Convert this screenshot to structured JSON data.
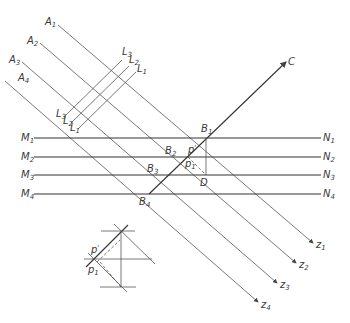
{
  "diagram": {
    "type": "geometric-construction",
    "rays": [
      {
        "start_label": "A",
        "start_sub": "1",
        "end_label": "z",
        "end_sub": "1"
      },
      {
        "start_label": "A",
        "start_sub": "2",
        "end_label": "z",
        "end_sub": "2"
      },
      {
        "start_label": "A",
        "start_sub": "3",
        "end_label": "z",
        "end_sub": "3"
      },
      {
        "start_label": "A",
        "start_sub": "4",
        "end_label": "z",
        "end_sub": "4"
      }
    ],
    "horizontals": [
      {
        "left_label": "M",
        "left_sub": "1",
        "right_label": "N",
        "right_sub": "1"
      },
      {
        "left_label": "M",
        "left_sub": "2",
        "right_label": "N",
        "right_sub": "2"
      },
      {
        "left_label": "M",
        "left_sub": "3",
        "right_label": "N",
        "right_sub": "3"
      },
      {
        "left_label": "M",
        "left_sub": "4",
        "right_label": "N",
        "right_sub": "4"
      }
    ],
    "intersections": [
      {
        "label": "B",
        "sub": "1"
      },
      {
        "label": "B",
        "sub": "2"
      },
      {
        "label": "B",
        "sub": "3"
      },
      {
        "label": "B",
        "sub": "4"
      }
    ],
    "ray_c_label": "C",
    "point_d_label": "D",
    "angle_upper": {
      "label": "p",
      "sup": "'"
    },
    "angle_lower": {
      "label": "p",
      "sub": "1"
    },
    "l_marks_upper": [
      {
        "label": "L",
        "sub": "3"
      },
      {
        "label": "L",
        "sub": "2"
      },
      {
        "label": "L",
        "sub": "1"
      }
    ],
    "l_marks_lower": [
      {
        "label": "L",
        "sub": "3"
      },
      {
        "label": "L",
        "sub": "2"
      },
      {
        "label": "L",
        "sub": "1"
      }
    ],
    "inset": {
      "angle_upper": {
        "label": "p",
        "sup": "'"
      },
      "angle_lower": {
        "label": "p",
        "sub": "1"
      }
    }
  }
}
